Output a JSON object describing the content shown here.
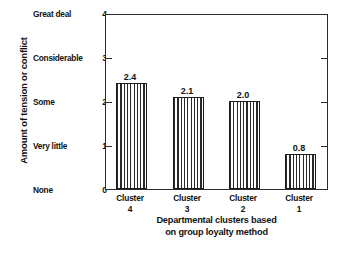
{
  "chart_data": {
    "type": "bar",
    "title": "",
    "categories": [
      "Cluster 4",
      "Cluster 3",
      "Cluster 2",
      "Cluster 1"
    ],
    "category_lines": [
      [
        "Cluster",
        "4"
      ],
      [
        "Cluster",
        "3"
      ],
      [
        "Cluster",
        "2"
      ],
      [
        "Cluster",
        "1"
      ]
    ],
    "values": [
      2.4,
      2.1,
      2.0,
      0.8
    ],
    "value_labels": [
      "2.4",
      "2.1",
      "2.0",
      "0.8"
    ],
    "xlabel": "Departmental clusters based on group loyalty method",
    "xlabel_lines": [
      "Departmental clusters based",
      "on group loyalty method"
    ],
    "ylabel": "Amount of tension or conflict",
    "ylim": [
      0,
      4
    ],
    "yticks": [
      0,
      1,
      2,
      3,
      4
    ],
    "ytick_labels": [
      "0",
      "1",
      "2",
      "3",
      "4"
    ],
    "ytick_semantic_labels": [
      "None",
      "Very little",
      "Some",
      "Considerable",
      "Great deal"
    ],
    "grid": false,
    "legend": "none",
    "bar_fill": "vertical-line-hatch",
    "axis_color": "#2b2b2b",
    "bar_outline_color": "#1d1d1d"
  }
}
